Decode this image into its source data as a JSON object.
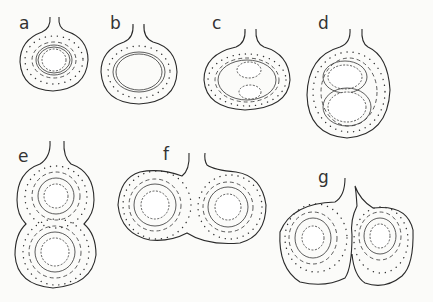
{
  "figure": {
    "panels": [
      {
        "label": "a",
        "cavities": 1
      },
      {
        "label": "b",
        "cavities": 0
      },
      {
        "label": "c",
        "cavities": 2
      },
      {
        "label": "d",
        "cavities": 2
      },
      {
        "label": "e",
        "cavities": 2
      },
      {
        "label": "f",
        "cavities": 2
      },
      {
        "label": "g",
        "cavities": 2
      }
    ]
  }
}
